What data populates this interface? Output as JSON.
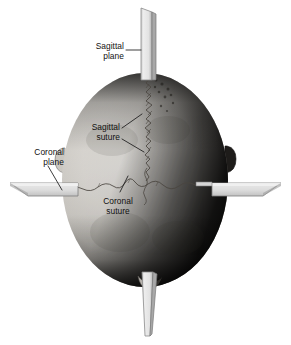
{
  "figure": {
    "background_color": "#ffffff",
    "labels": {
      "sagittal_plane": "Sagittal\nplane",
      "sagittal_suture": "Sagittal\nsuture",
      "coronal_plane": "Coronal\nplane",
      "coronal_suture": "Coronal\nsuture"
    },
    "colors": {
      "label_text": "#111111",
      "leader_line": "#1a1a1a",
      "plane_face": "#e6e6e6",
      "plane_face_shadow": "#b9b9b9",
      "plane_edge": "#8f8f8f",
      "skull_light": "#e3e1dc",
      "skull_mid": "#c9c6c0",
      "skull_dark": "#2a2724",
      "suture_line": "#55504a"
    },
    "structures": [
      "sagittal plane",
      "coronal plane",
      "sagittal suture",
      "coronal suture",
      "skull (superior view)"
    ]
  }
}
